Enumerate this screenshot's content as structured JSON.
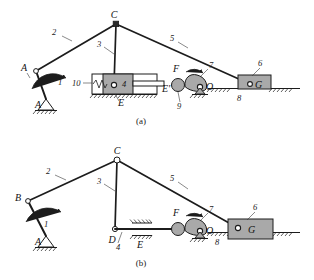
{
  "figure": {
    "background_color": "#ffffff",
    "line_color": "#1c1c1c",
    "body_fill_color": "#a9a9a9",
    "captions": {
      "a": "(a)",
      "b": "(b)"
    }
  },
  "diagram_a": {
    "caption": "(a)",
    "joint_labels": {
      "A": "A",
      "B": "B",
      "C": "C",
      "E": "E",
      "E_prime": "E'",
      "F": "F",
      "O": "O",
      "G": "G"
    },
    "link_numbers": {
      "crank": "1",
      "coupler": "2",
      "vertical_link": "3",
      "slider_block": "4",
      "long_link": "5",
      "output_slider": "6",
      "cam": "7",
      "frame": "8",
      "roller": "9",
      "spring": "10"
    }
  },
  "diagram_b": {
    "caption": "(b)",
    "joint_labels": {
      "A": "A",
      "B": "B",
      "C": "C",
      "D": "D",
      "E": "E",
      "F": "F",
      "O": "O",
      "G": "G"
    },
    "link_numbers": {
      "crank": "1",
      "coupler": "2",
      "vertical_link": "3",
      "slider_rod": "4",
      "long_link": "5",
      "output_slider": "6",
      "cam": "7",
      "frame": "8"
    }
  }
}
